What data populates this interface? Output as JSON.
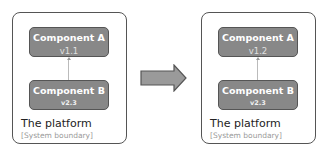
{
  "diagram": {
    "before": {
      "boundary_title": "The platform",
      "boundary_subtitle": "[System boundary]",
      "component_a": {
        "name": "Component A",
        "version": "v1.1"
      },
      "component_b": {
        "name": "Component B",
        "version": "v2.3"
      }
    },
    "after": {
      "boundary_title": "The platform",
      "boundary_subtitle": "[System boundary]",
      "component_a": {
        "name": "Component A",
        "version": "v1.2"
      },
      "component_b": {
        "name": "Component B",
        "version": "v2.3"
      }
    },
    "transition_arrow": "right-arrow-icon"
  },
  "colors": {
    "component_fill": "#888888",
    "component_border": "#555555",
    "boundary_border": "#555555",
    "arrow_fill": "#999999"
  }
}
